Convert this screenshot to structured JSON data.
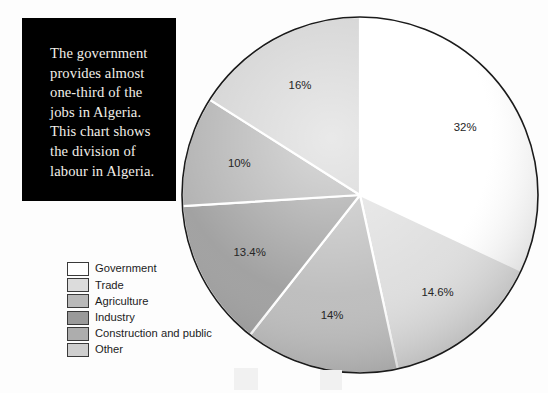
{
  "caption": {
    "text": "The government\nprovides almost\none-third of the\njobs in Algeria.\nThis chart shows\nthe division of\nlabour in Algeria.",
    "background": "#000000",
    "color": "#f2efe9"
  },
  "legend": {
    "items": [
      {
        "label": "Government",
        "color": "#ffffff"
      },
      {
        "label": "Trade",
        "color": "#dcdcdc"
      },
      {
        "label": "Agriculture",
        "color": "#b9b9b9"
      },
      {
        "label": "Industry",
        "color": "#9a9a9a"
      },
      {
        "label": "Construction and public",
        "color": "#adadad"
      },
      {
        "label": "Other",
        "color": "#cfcfcf"
      }
    ]
  },
  "chart_data": {
    "type": "pie",
    "title": "",
    "labels": [
      "Government",
      "Trade",
      "Agriculture",
      "Industry",
      "Construction and public",
      "Other"
    ],
    "values": [
      32,
      14.6,
      14,
      13.4,
      10,
      16
    ],
    "value_labels": [
      "32%",
      "14.6%",
      "14%",
      "13.4%",
      "10%",
      "16%"
    ],
    "colors": [
      "#ffffff",
      "#dcdcdc",
      "#b9b9b9",
      "#9a9a9a",
      "#adadad",
      "#cfcfcf"
    ],
    "start_angle_deg": 0,
    "direction": "clockwise",
    "legend_position": "left-bottom",
    "grid": false,
    "units": "percent",
    "note": "Division of labour in Algeria"
  },
  "geometry": {
    "cx": 179,
    "cy": 181,
    "rx": 178,
    "ry": 178
  }
}
